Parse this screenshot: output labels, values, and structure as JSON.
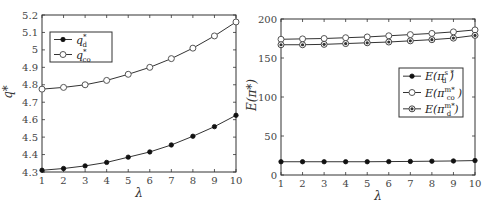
{
  "chart_data": [
    {
      "type": "line",
      "title": "",
      "xlabel": "λ",
      "ylabel": "q*",
      "x": [
        1,
        2,
        3,
        4,
        5,
        6,
        7,
        8,
        9,
        10
      ],
      "xticks": [
        "1",
        "2",
        "3",
        "4",
        "5",
        "6",
        "7",
        "8",
        "9",
        "10"
      ],
      "yticks": [
        "4.3",
        "4.4",
        "4.5",
        "4.6",
        "4.7",
        "4.8",
        "4.9",
        "5",
        "5.1",
        "5.2"
      ],
      "ylim": [
        4.3,
        5.2
      ],
      "xlim": [
        1,
        10
      ],
      "grid": false,
      "legend_position": "upper left",
      "series": [
        {
          "name": "q_d*",
          "label_main": "q",
          "label_sub": "d",
          "label_sup": "*",
          "marker": "filled-circle",
          "values": [
            4.31,
            4.32,
            4.335,
            4.355,
            4.385,
            4.415,
            4.455,
            4.505,
            4.56,
            4.625
          ]
        },
        {
          "name": "q_co*",
          "label_main": "q",
          "label_sub": "co",
          "label_sup": "*",
          "marker": "open-circle",
          "values": [
            4.775,
            4.785,
            4.8,
            4.825,
            4.86,
            4.9,
            4.95,
            5.01,
            5.08,
            5.16
          ]
        }
      ]
    },
    {
      "type": "line",
      "title": "",
      "xlabel": "λ",
      "ylabel": "E(π*)",
      "x": [
        1,
        2,
        3,
        4,
        5,
        6,
        7,
        8,
        9,
        10
      ],
      "xticks": [
        "1",
        "2",
        "3",
        "4",
        "5",
        "6",
        "7",
        "8",
        "9",
        "10"
      ],
      "yticks": [
        "0",
        "50",
        "100",
        "150",
        "200"
      ],
      "ylim": [
        0,
        200
      ],
      "xlim": [
        1,
        10
      ],
      "grid": false,
      "legend_position": "center right",
      "series": [
        {
          "name": "E(π_d^s*)",
          "label_main": "E(π",
          "label_sub": "d",
          "label_sup": "s *",
          "marker": "filled-circle",
          "values": [
            17,
            17,
            17,
            17,
            17,
            17.2,
            17.4,
            17.7,
            18,
            18.5
          ]
        },
        {
          "name": "E(π_co^m*)",
          "label_main": "E(π",
          "label_sub": "co",
          "label_sup": "m*",
          "marker": "open-circle",
          "values": [
            174,
            174.5,
            175,
            176,
            177,
            178.5,
            180,
            181.5,
            183.5,
            186
          ]
        },
        {
          "name": "E(π_d^m*)",
          "label_main": "E(π",
          "label_sub": "d",
          "label_sup": "m*",
          "marker": "half-filled-circle",
          "values": [
            167,
            167,
            167.5,
            168.5,
            169.5,
            170.5,
            172,
            173.5,
            175.5,
            179
          ]
        }
      ]
    }
  ]
}
